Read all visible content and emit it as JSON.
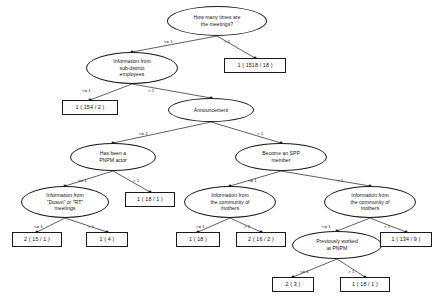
{
  "diagram": {
    "type": "decision-tree",
    "nodes": [
      {
        "id": "n0",
        "kind": "decision",
        "label": "How many times are\nthe meetings?",
        "x": 167,
        "y": 6,
        "w": 100,
        "h": 30
      },
      {
        "id": "n1",
        "kind": "decision",
        "label": "Information from\nsub-district\nemployees",
        "x": 86,
        "y": 52,
        "w": 92,
        "h": 32
      },
      {
        "id": "l1",
        "kind": "leaf",
        "label": "1 ( 1518 / 18 )",
        "x": 224,
        "y": 58,
        "w": 62,
        "h": 15
      },
      {
        "id": "l2",
        "kind": "leaf",
        "label": "1 ( 154 / 2 )",
        "x": 62,
        "y": 100,
        "w": 56,
        "h": 15
      },
      {
        "id": "n2",
        "kind": "decision",
        "label": "Announcement",
        "x": 168,
        "y": 98,
        "w": 86,
        "h": 24
      },
      {
        "id": "n3",
        "kind": "decision",
        "label": "Has been a\nPNPM actor",
        "x": 70,
        "y": 143,
        "w": 86,
        "h": 28
      },
      {
        "id": "n4",
        "kind": "decision",
        "label": "Become an SPP\nmember",
        "x": 235,
        "y": 143,
        "w": 92,
        "h": 28
      },
      {
        "id": "n5",
        "kind": "decision",
        "label": "Information from\n\"Dusun\" or \"RT\"\nmeetings",
        "x": 21,
        "y": 186,
        "w": 88,
        "h": 32
      },
      {
        "id": "l3",
        "kind": "leaf",
        "label": "1 ( 18 / 1 )",
        "x": 125,
        "y": 192,
        "w": 50,
        "h": 15
      },
      {
        "id": "n6",
        "kind": "decision",
        "label": "Information from\nthe community of\nmothers",
        "x": 184,
        "y": 186,
        "w": 92,
        "h": 32
      },
      {
        "id": "n7",
        "kind": "decision",
        "label": "Information from\nthe community of\nmothers",
        "x": 324,
        "y": 186,
        "w": 92,
        "h": 32
      },
      {
        "id": "l4",
        "kind": "leaf",
        "label": "2 ( 15 / 1 )",
        "x": 12,
        "y": 232,
        "w": 50,
        "h": 15
      },
      {
        "id": "l5",
        "kind": "leaf",
        "label": "1 ( 4 )",
        "x": 86,
        "y": 232,
        "w": 42,
        "h": 15
      },
      {
        "id": "l6",
        "kind": "leaf",
        "label": "1 ( 18 )",
        "x": 176,
        "y": 232,
        "w": 44,
        "h": 15
      },
      {
        "id": "l7",
        "kind": "leaf",
        "label": "2 ( 16 / 2 )",
        "x": 236,
        "y": 232,
        "w": 50,
        "h": 15
      },
      {
        "id": "n8",
        "kind": "decision",
        "label": "Previously worked\nat PNPM",
        "x": 292,
        "y": 231,
        "w": 90,
        "h": 28
      },
      {
        "id": "l8",
        "kind": "leaf",
        "label": "1 ( 134 / 9 )",
        "x": 380,
        "y": 232,
        "w": 52,
        "h": 15
      },
      {
        "id": "l9",
        "kind": "leaf",
        "label": "2 ( 3 )",
        "x": 272,
        "y": 277,
        "w": 42,
        "h": 15
      },
      {
        "id": "l10",
        "kind": "leaf",
        "label": "1 ( 18 / 1 )",
        "x": 340,
        "y": 277,
        "w": 50,
        "h": 15
      }
    ],
    "edges": [
      {
        "from": "n0",
        "to": "n1",
        "label": "<= 1",
        "lx": 164,
        "ly": 39
      },
      {
        "from": "n0",
        "to": "l1",
        "label": "> 1",
        "lx": 224,
        "ly": 39
      },
      {
        "from": "n1",
        "to": "l2",
        "label": "<= 1",
        "lx": 82,
        "ly": 88
      },
      {
        "from": "n1",
        "to": "n2",
        "label": "> 1",
        "lx": 148,
        "ly": 88
      },
      {
        "from": "n2",
        "to": "n3",
        "label": "<= 1",
        "lx": 139,
        "ly": 131
      },
      {
        "from": "n2",
        "to": "n4",
        "label": "> 1",
        "lx": 257,
        "ly": 131
      },
      {
        "from": "n3",
        "to": "n5",
        "label": "<= 1",
        "lx": 78,
        "ly": 178
      },
      {
        "from": "n3",
        "to": "l3",
        "label": "> 1",
        "lx": 133,
        "ly": 178
      },
      {
        "from": "n4",
        "to": "n6",
        "label": "<= 1",
        "lx": 248,
        "ly": 178
      },
      {
        "from": "n4",
        "to": "n7",
        "label": "> 1",
        "lx": 337,
        "ly": 178
      },
      {
        "from": "n5",
        "to": "l4",
        "label": "<= 1",
        "lx": 34,
        "ly": 224
      },
      {
        "from": "n5",
        "to": "l5",
        "label": "> 1",
        "lx": 88,
        "ly": 224
      },
      {
        "from": "n6",
        "to": "l6",
        "label": "<= 1",
        "lx": 196,
        "ly": 224
      },
      {
        "from": "n6",
        "to": "l7",
        "label": "> 1",
        "lx": 244,
        "ly": 224
      },
      {
        "from": "n7",
        "to": "n8",
        "label": "<= 1",
        "lx": 322,
        "ly": 224
      },
      {
        "from": "n7",
        "to": "l8",
        "label": "> 1",
        "lx": 384,
        "ly": 224
      },
      {
        "from": "n8",
        "to": "l9",
        "label": "<= 1",
        "lx": 300,
        "ly": 269
      },
      {
        "from": "n8",
        "to": "l10",
        "label": "> 1",
        "lx": 348,
        "ly": 269
      }
    ],
    "style": {
      "stroke": "#1a1a1a",
      "node_fill": "#ffffff",
      "text_color": "#111111",
      "background": "#ffffff"
    }
  }
}
